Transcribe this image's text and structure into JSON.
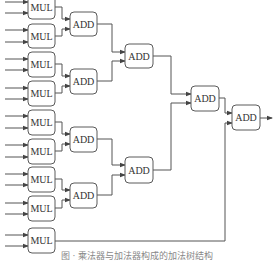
{
  "diagram": {
    "colors": {
      "stroke": "#555555",
      "text": "#333333",
      "background": "#ffffff"
    },
    "mul_label": "MUL",
    "add_label": "ADD",
    "mul_nodes": [
      {
        "id": "mul1",
        "label": "MUL",
        "x": 28,
        "y": -5
      },
      {
        "id": "mul2",
        "label": "MUL",
        "x": 28,
        "y": 24
      },
      {
        "id": "mul3",
        "label": "MUL",
        "x": 28,
        "y": 52
      },
      {
        "id": "mul4",
        "label": "MUL",
        "x": 28,
        "y": 81
      },
      {
        "id": "mul5",
        "label": "MUL",
        "x": 28,
        "y": 110
      },
      {
        "id": "mul6",
        "label": "MUL",
        "x": 28,
        "y": 139
      },
      {
        "id": "mul7",
        "label": "MUL",
        "x": 28,
        "y": 167
      },
      {
        "id": "mul8",
        "label": "MUL",
        "x": 28,
        "y": 196
      },
      {
        "id": "mul9",
        "label": "MUL",
        "x": 28,
        "y": 228
      }
    ],
    "add_nodes": [
      {
        "id": "add1_1",
        "label": "ADD",
        "level": 1,
        "x": 70,
        "y": 12
      },
      {
        "id": "add1_2",
        "label": "ADD",
        "level": 1,
        "x": 70,
        "y": 69
      },
      {
        "id": "add1_3",
        "label": "ADD",
        "level": 1,
        "x": 70,
        "y": 127
      },
      {
        "id": "add1_4",
        "label": "ADD",
        "level": 1,
        "x": 70,
        "y": 183
      },
      {
        "id": "add2_1",
        "label": "ADD",
        "level": 2,
        "x": 125,
        "y": 44
      },
      {
        "id": "add2_2",
        "label": "ADD",
        "level": 2,
        "x": 125,
        "y": 157
      },
      {
        "id": "add3_1",
        "label": "ADD",
        "level": 3,
        "x": 191,
        "y": 86
      },
      {
        "id": "add4_1",
        "label": "ADD",
        "level": 4,
        "x": 232,
        "y": 105
      }
    ],
    "edges": [
      [
        "mul1",
        "add1_1"
      ],
      [
        "mul2",
        "add1_1"
      ],
      [
        "mul3",
        "add1_2"
      ],
      [
        "mul4",
        "add1_2"
      ],
      [
        "mul5",
        "add1_3"
      ],
      [
        "mul6",
        "add1_3"
      ],
      [
        "mul7",
        "add1_4"
      ],
      [
        "mul8",
        "add1_4"
      ],
      [
        "add1_1",
        "add2_1"
      ],
      [
        "add1_2",
        "add2_1"
      ],
      [
        "add1_3",
        "add2_2"
      ],
      [
        "add1_4",
        "add2_2"
      ],
      [
        "add2_1",
        "add3_1"
      ],
      [
        "add2_2",
        "add3_1"
      ],
      [
        "add3_1",
        "add4_1"
      ],
      [
        "mul9",
        "add4_1"
      ]
    ],
    "caption": "图 · 乘法器与加法器构成的加法树结构"
  }
}
